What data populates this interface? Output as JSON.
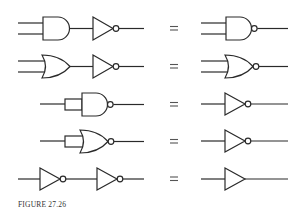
{
  "figure": {
    "caption": "FIGURE 27.26",
    "ink_color": "#2a2a2a",
    "background": "#ffffff"
  },
  "equivalences": [
    {
      "row": 1,
      "left": [
        "AND",
        "NOT"
      ],
      "equals": "=",
      "right": [
        "NAND"
      ]
    },
    {
      "row": 2,
      "left": [
        "OR",
        "NOT"
      ],
      "equals": "=",
      "right": [
        "NOR"
      ]
    },
    {
      "row": 3,
      "left": [
        "NAND (inputs tied)"
      ],
      "equals": "=",
      "right": [
        "NOT"
      ]
    },
    {
      "row": 4,
      "left": [
        "NOR (inputs tied)"
      ],
      "equals": "=",
      "right": [
        "NOT"
      ]
    },
    {
      "row": 5,
      "left": [
        "NOT",
        "NOT"
      ],
      "equals": "=",
      "right": [
        "BUFFER"
      ]
    }
  ],
  "equals_symbol": "="
}
